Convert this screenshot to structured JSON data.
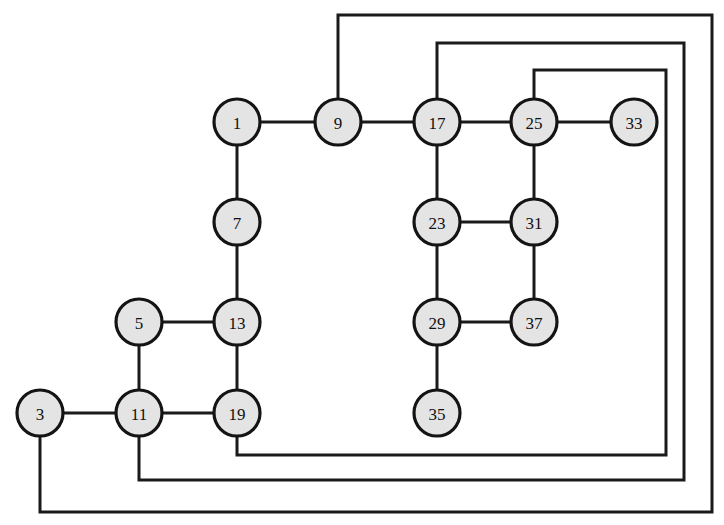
{
  "diagram": {
    "type": "node-link-graph",
    "canvas": {
      "width": 724,
      "height": 525
    },
    "style": {
      "node_fill": "#e4e4e4",
      "node_stroke": "#141414",
      "edge_color": "#1a1a1a",
      "background": "#ffffff",
      "node_radius": 23,
      "edge_width": 3
    },
    "nodes": [
      {
        "id": "n1",
        "label": "1",
        "x": 237,
        "y": 122
      },
      {
        "id": "n9",
        "label": "9",
        "x": 338,
        "y": 122
      },
      {
        "id": "n17",
        "label": "17",
        "x": 437,
        "y": 122
      },
      {
        "id": "n25",
        "label": "25",
        "x": 534,
        "y": 122
      },
      {
        "id": "n33",
        "label": "33",
        "x": 634,
        "y": 122
      },
      {
        "id": "n7",
        "label": "7",
        "x": 237,
        "y": 222
      },
      {
        "id": "n23",
        "label": "23",
        "x": 437,
        "y": 222
      },
      {
        "id": "n31",
        "label": "31",
        "x": 534,
        "y": 222
      },
      {
        "id": "n5",
        "label": "5",
        "x": 139,
        "y": 322
      },
      {
        "id": "n13",
        "label": "13",
        "x": 237,
        "y": 322
      },
      {
        "id": "n29",
        "label": "29",
        "x": 437,
        "y": 322
      },
      {
        "id": "n37",
        "label": "37",
        "x": 534,
        "y": 322
      },
      {
        "id": "n35",
        "label": "35",
        "x": 437,
        "y": 413
      },
      {
        "id": "n3",
        "label": "3",
        "x": 40,
        "y": 413
      },
      {
        "id": "n11",
        "label": "11",
        "x": 139,
        "y": 413
      },
      {
        "id": "n19",
        "label": "19",
        "x": 237,
        "y": 413
      }
    ],
    "edges": [
      {
        "id": "e1-9",
        "from": "n1",
        "to": "n9",
        "label": "1-9"
      },
      {
        "id": "e9-17",
        "from": "n9",
        "to": "n17",
        "label": "9-17"
      },
      {
        "id": "e17-25",
        "from": "n17",
        "to": "n25",
        "label": "17-25"
      },
      {
        "id": "e25-33",
        "from": "n25",
        "to": "n33",
        "label": "25-33"
      },
      {
        "id": "e1-7",
        "from": "n1",
        "to": "n7",
        "label": "1-7"
      },
      {
        "id": "e7-13",
        "from": "n7",
        "to": "n13",
        "label": "7-13"
      },
      {
        "id": "e17-23",
        "from": "n17",
        "to": "n23",
        "label": "17-23"
      },
      {
        "id": "e25-31",
        "from": "n25",
        "to": "n31",
        "label": "25-31"
      },
      {
        "id": "e23-31",
        "from": "n23",
        "to": "n31",
        "label": "23-31"
      },
      {
        "id": "e23-29",
        "from": "n23",
        "to": "n29",
        "label": "23-29"
      },
      {
        "id": "e31-37",
        "from": "n31",
        "to": "n37",
        "label": "31-37"
      },
      {
        "id": "e29-37",
        "from": "n29",
        "to": "n37",
        "label": "29-37"
      },
      {
        "id": "e29-35",
        "from": "n29",
        "to": "n35",
        "label": "29-35"
      },
      {
        "id": "e5-13",
        "from": "n5",
        "to": "n13",
        "label": "5-13"
      },
      {
        "id": "e5-11",
        "from": "n5",
        "to": "n11",
        "label": "5-11"
      },
      {
        "id": "e13-19",
        "from": "n13",
        "to": "n19",
        "label": "13-19"
      },
      {
        "id": "e3-11",
        "from": "n3",
        "to": "n11",
        "label": "3-11"
      },
      {
        "id": "e11-19",
        "from": "n11",
        "to": "n19",
        "label": "11-19"
      }
    ],
    "wrap_edges": [
      {
        "id": "w9-3",
        "from": "n9",
        "to": "n3",
        "label": "9-3 wrap",
        "points": "338,99 338,15 712,15 712,512 40,512 40,436"
      },
      {
        "id": "w17-11",
        "from": "n17",
        "to": "n11",
        "label": "17-11 wrap",
        "points": "437,99 437,43 684,43 684,480 139,480 139,436"
      },
      {
        "id": "w25-19",
        "from": "n25",
        "to": "n19",
        "label": "25-19 wrap",
        "points": "534,99 534,70 666,70 666,455 237,455 237,436"
      }
    ]
  }
}
